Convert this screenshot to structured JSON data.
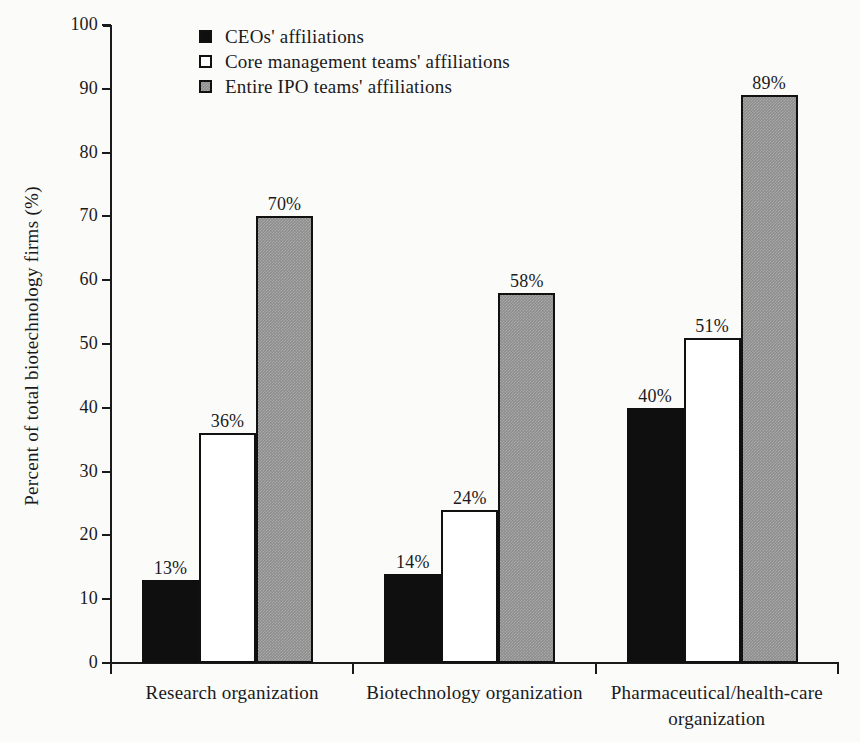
{
  "chart_data": {
    "type": "bar",
    "title": "",
    "subtitle": "",
    "xlabel": "",
    "ylabel": "Percent of total biotechnology firms (%)",
    "ylim": [
      0,
      100
    ],
    "ytick_step": 10,
    "yticks": [
      100,
      90,
      80,
      70,
      60,
      50,
      40,
      30,
      20,
      10,
      0
    ],
    "ytick_labels": [
      "100",
      "90",
      "80",
      "70",
      "60",
      "50",
      "40",
      "30",
      "20",
      "10",
      "0"
    ],
    "grid": false,
    "legend_position": "top-left-inside",
    "value_label_suffix": "%",
    "categories": [
      "Research organization",
      "Biotechnology organization",
      "Pharmaceutical/health-care organization"
    ],
    "series": [
      {
        "name": "CEOs' affiliations",
        "color": "#0f0f0f",
        "values": [
          13,
          36,
          70
        ],
        "value_labels": [
          "13%",
          "14%",
          "40%"
        ]
      },
      {
        "name": "Core management teams' affiliations",
        "color": "#ffffff",
        "values": [
          36,
          24,
          51
        ],
        "value_labels": [
          "36%",
          "24%",
          "51%"
        ]
      },
      {
        "name": "Entire IPO teams' affiliations",
        "color": "#8d8d8d",
        "values": [
          70,
          58,
          89
        ],
        "value_labels": [
          "70%",
          "58%",
          "89%"
        ]
      }
    ],
    "groups": [
      {
        "category": "Research organization",
        "bars": [
          {
            "series": "CEOs' affiliations",
            "value": 13,
            "label": "13%"
          },
          {
            "series": "Core management teams' affiliations",
            "value": 36,
            "label": "36%"
          },
          {
            "series": "Entire IPO teams' affiliations",
            "value": 70,
            "label": "70%"
          }
        ]
      },
      {
        "category": "Biotechnology organization",
        "bars": [
          {
            "series": "CEOs' affiliations",
            "value": 14,
            "label": "14%"
          },
          {
            "series": "Core management teams' affiliations",
            "value": 24,
            "label": "24%"
          },
          {
            "series": "Entire IPO teams' affiliations",
            "value": 58,
            "label": "58%"
          }
        ]
      },
      {
        "category": "Pharmaceutical/health-care organization",
        "bars": [
          {
            "series": "CEOs' affiliations",
            "value": 40,
            "label": "40%"
          },
          {
            "series": "Core management teams' affiliations",
            "value": 51,
            "label": "51%"
          },
          {
            "series": "Entire IPO teams' affiliations",
            "value": 89,
            "label": "89%"
          }
        ]
      }
    ]
  },
  "legend": {
    "items": [
      {
        "label": "CEOs' affiliations",
        "swatch": "black-filled-square"
      },
      {
        "label": "Core management teams' affiliations",
        "swatch": "white-outlined-square"
      },
      {
        "label": "Entire IPO teams' affiliations",
        "swatch": "gray-filled-square"
      }
    ]
  },
  "axes": {
    "y_title": "Percent of total biotechnology firms (%)",
    "y_labels": [
      "100",
      "90",
      "80",
      "70",
      "60",
      "50",
      "40",
      "30",
      "20",
      "10",
      "0"
    ],
    "x_labels": [
      "Research organization",
      "Biotechnology organization",
      "Pharmaceutical/health-care organization"
    ],
    "x_labels_line1": [
      "Research organization",
      "Biotechnology organization",
      "Pharmaceutical/health-care"
    ],
    "x_labels_line2": [
      "",
      "",
      "organization"
    ]
  },
  "colors": {
    "series_ceo": "#0f0f0f",
    "series_core": "#ffffff",
    "series_ipo": "#8d8d8d",
    "axis": "#1a1a1a",
    "background": "#fbfbfa"
  }
}
